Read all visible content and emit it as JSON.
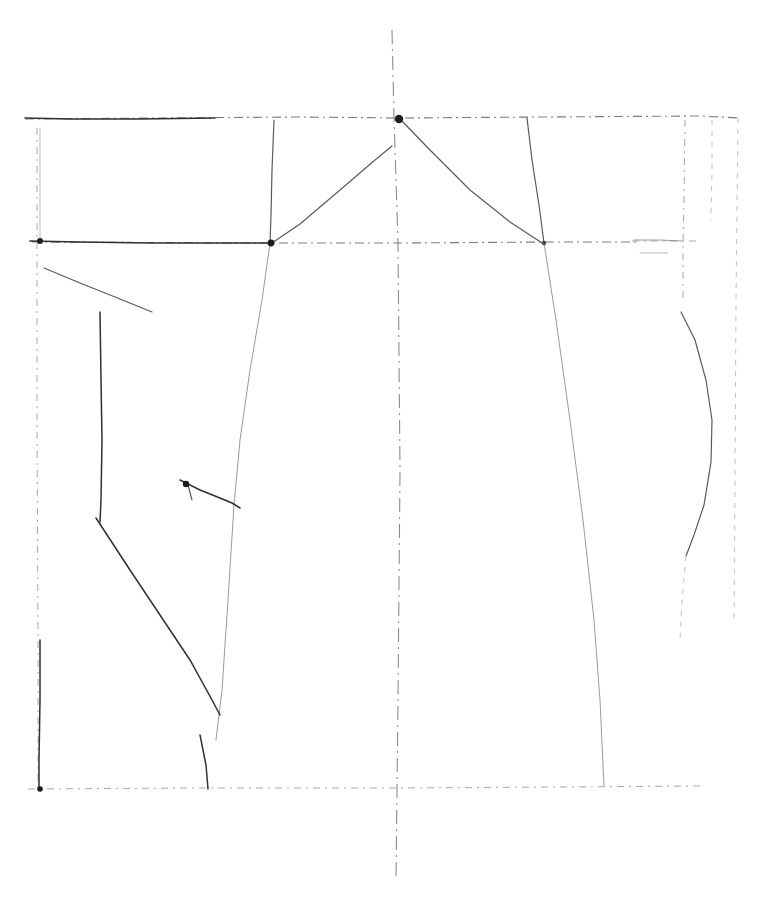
{
  "document": {
    "kind": "scanned-line-drawing",
    "subject": "kimono-style garment pattern draft",
    "background_color": "#ffffff",
    "ink_colors": {
      "darkest": "#1d1d1d",
      "dark": "#303030",
      "mid": "#5a5a5a",
      "faint": "#9a9a9a",
      "ghost": "#c2c2c2"
    },
    "canvas": {
      "width": 772,
      "height": 922
    }
  },
  "drawing": {
    "title": "",
    "caption": "",
    "paper_tone": "#ffffff",
    "construction_lines": [
      {
        "name": "centre-fold-line",
        "style": "ln-centre",
        "points": "392,30 394,118 398,242 400,470 398,700 396,880"
      },
      {
        "name": "top-horizontal-shoulder-line",
        "style": "ln-dash-mid",
        "points": "25,119 300,117 400,118 540,117 700,116 740,118"
      },
      {
        "name": "upper-guide-left-tick",
        "style": "ln-ghost",
        "points": "40,128 40,240"
      },
      {
        "name": "chest-horizontal-line",
        "style": "ln-dash-mid",
        "points": "32,242 270,243 400,243 546,242 640,242"
      },
      {
        "name": "chest-horizontal-line-right-stub",
        "style": "ln-dash-faint",
        "points": "632,241 700,241"
      },
      {
        "name": "hem-horizontal-line",
        "style": "ln-dash-faint",
        "points": "28,789 200,788 400,788 560,787 700,786"
      },
      {
        "name": "left-vertical-margin",
        "style": "ln-dash-faint",
        "points": "37,128 37,420 38,640 38,789"
      },
      {
        "name": "right-vertical-margin",
        "style": "ln-dash-ghost",
        "points": "738,118 736,300 735,480 734,620"
      }
    ],
    "pattern_outlines": [
      {
        "name": "left-shoulder-edge-dark",
        "style": "ln-solid-dark",
        "points": "25,118 70,119 140,119 215,118"
      },
      {
        "name": "chest-line-left-dark",
        "style": "ln-solid-dark",
        "points": "30,241 80,242 150,243 230,243 272,243"
      },
      {
        "name": "shoulder-to-armhole-left",
        "style": "ln-solid-mid",
        "points": "274,120 272,170 271,215 270,243"
      },
      {
        "name": "neckline-left-slope",
        "style": "ln-solid-mid",
        "points": "272,243 300,224 340,190 375,160 392,146"
      },
      {
        "name": "neckline-right-slope",
        "style": "ln-solid-mid",
        "points": "400,119 430,150 470,190 510,222 542,243"
      },
      {
        "name": "shoulder-to-armhole-right",
        "style": "ln-solid-mid",
        "points": "527,118 532,160 539,205 544,243"
      },
      {
        "name": "right-body-side-seam",
        "style": "ln-solid-faint",
        "points": "544,243 556,320 570,420 583,520 594,620 600,700 604,786"
      },
      {
        "name": "left-body-side-seam-long-diagonal",
        "style": "ln-solid-faint",
        "points": "270,243 262,300 250,370 240,440 234,505 228,600 222,690 216,740"
      },
      {
        "name": "left-sleeve-top-edge",
        "style": "ln-solid-mid",
        "points": "44,268 80,283 120,299 152,312"
      },
      {
        "name": "left-sleeve-front-vertical",
        "style": "ln-solid-dark",
        "points": "100,312 101,380 102,440 101,500 100,522"
      },
      {
        "name": "left-sleeve-under-diagonal",
        "style": "ln-solid-dark",
        "points": "96,518 130,570 160,615 190,660 212,700 220,715"
      },
      {
        "name": "left-underarm-notch",
        "style": "ln-solid-dark",
        "points": "180,480 200,490 215,496 232,503 240,508"
      },
      {
        "name": "left-underarm-notch-stub",
        "style": "ln-solid-mid",
        "points": "188,485 192,500"
      },
      {
        "name": "left-lower-vertical",
        "style": "ln-solid-dark",
        "points": "40,640 40,700 39,760 39,789"
      },
      {
        "name": "left-hem-corner-tick",
        "style": "ln-solid-dark",
        "points": "200,735 206,765 208,789"
      },
      {
        "name": "okumi-panel-vertical",
        "style": "ln-dash-faint",
        "points": "685,120 684,200 683,245 683,300"
      },
      {
        "name": "okumi-panel-curve",
        "style": "ln-solid-mid",
        "points": "681,312 695,340 706,380 712,420 711,462 704,505 694,535 686,556"
      },
      {
        "name": "okumi-curve-tail",
        "style": "ln-dash-ghost",
        "points": "686,556 682,600 680,640"
      },
      {
        "name": "collar-stub-horizontal",
        "style": "ln-solid-faint",
        "points": "634,240 660,240 682,241"
      },
      {
        "name": "collar-stub-under",
        "style": "ln-ghost",
        "points": "640,253 668,253"
      },
      {
        "name": "right-outer-edge-upper",
        "style": "ln-dash-ghost",
        "points": "712,120 712,170 711,220"
      }
    ],
    "nodes": [
      {
        "name": "centre-neck-apex-node",
        "cx": 399,
        "cy": 119,
        "r": 4.2,
        "tone": "node-dark"
      },
      {
        "name": "left-armhole-node",
        "cx": 271,
        "cy": 243,
        "r": 3.4,
        "tone": "node-dark"
      },
      {
        "name": "right-armhole-node",
        "cx": 544,
        "cy": 243,
        "r": 2.2,
        "tone": "node-mid"
      },
      {
        "name": "left-chest-origin-node",
        "cx": 40,
        "cy": 241,
        "r": 3.0,
        "tone": "node-dark"
      },
      {
        "name": "left-underarm-node",
        "cx": 186,
        "cy": 484,
        "r": 3.2,
        "tone": "node-dark"
      },
      {
        "name": "left-hem-origin-node",
        "cx": 40,
        "cy": 789,
        "r": 2.8,
        "tone": "node-dark"
      }
    ]
  }
}
